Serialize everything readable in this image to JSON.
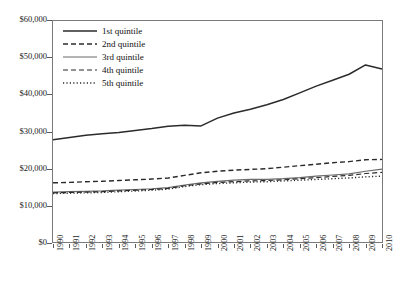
{
  "chart_data": {
    "type": "line",
    "title": "",
    "subtitle": "",
    "xlabel": "",
    "ylabel": "",
    "grid": false,
    "legend_position": "top-left-inside",
    "xlim": [
      1990,
      2010
    ],
    "ylim": [
      0,
      60000
    ],
    "y_tick_labels": [
      "$60,000",
      "$50,000",
      "$40,000",
      "$30,000",
      "$20,000",
      "$10,000",
      "$0"
    ],
    "y_tick_values": [
      60000,
      50000,
      40000,
      30000,
      20000,
      10000,
      0
    ],
    "x": [
      1990,
      1991,
      1992,
      1993,
      1994,
      1995,
      1996,
      1997,
      1998,
      1999,
      2000,
      2001,
      2002,
      2003,
      2004,
      2005,
      2006,
      2007,
      2008,
      2009,
      2010
    ],
    "categories": [
      "1990",
      "1991",
      "1992",
      "1993",
      "1994",
      "1995",
      "1996",
      "1997",
      "1998",
      "1999",
      "2000",
      "2001",
      "2002",
      "2003",
      "2004",
      "2005",
      "2006",
      "2007",
      "2008",
      "2009",
      "2010"
    ],
    "series": [
      {
        "name": "1st quintile",
        "style": "solid",
        "color": "#2b2b2b",
        "width": 1.5,
        "values": [
          27800,
          28400,
          29000,
          29400,
          29700,
          30300,
          30800,
          31400,
          31700,
          31500,
          33600,
          35000,
          36000,
          37200,
          38600,
          40400,
          42200,
          43800,
          45400,
          47900,
          46800
        ]
      },
      {
        "name": "2nd quintile",
        "style": "dashed",
        "color": "#2b2b2b",
        "width": 1.4,
        "values": [
          16200,
          16300,
          16500,
          16600,
          16800,
          17000,
          17200,
          17500,
          18200,
          18900,
          19300,
          19600,
          19800,
          20000,
          20400,
          20800,
          21200,
          21600,
          21900,
          22400,
          22500
        ]
      },
      {
        "name": "3rd quintile",
        "style": "solid",
        "color": "#6a6a6a",
        "width": 1.2,
        "values": [
          13700,
          13800,
          13900,
          14000,
          14200,
          14400,
          14600,
          14900,
          15600,
          16200,
          16600,
          16900,
          17100,
          17100,
          17300,
          17600,
          18000,
          18300,
          18600,
          19300,
          19900
        ]
      },
      {
        "name": "4th quintile",
        "style": "dashed",
        "color": "#2b2b2b",
        "width": 1.2,
        "values": [
          13500,
          13600,
          13700,
          13800,
          14000,
          14200,
          14400,
          14700,
          15400,
          15900,
          16300,
          16500,
          16700,
          16800,
          17000,
          17300,
          17600,
          17900,
          18200,
          18700,
          19000
        ]
      },
      {
        "name": "5th quintile",
        "style": "dotted",
        "color": "#2b2b2b",
        "width": 1.4,
        "values": [
          13300,
          13400,
          13500,
          13600,
          13800,
          14000,
          14200,
          14500,
          15200,
          15700,
          16000,
          16200,
          16400,
          16500,
          16700,
          16900,
          17100,
          17300,
          17500,
          17800,
          18000
        ]
      }
    ]
  },
  "legend": {
    "items": [
      {
        "label": "1st quintile"
      },
      {
        "label": "2nd quintile"
      },
      {
        "label": "3rd quintile"
      },
      {
        "label": "4th quintile"
      },
      {
        "label": "5th quintile"
      }
    ]
  },
  "axes": {
    "y_labels": [
      "$60,000",
      "$50,000",
      "$40,000",
      "$30,000",
      "$20,000",
      "$10,000",
      "$0"
    ],
    "x_labels": [
      "1990",
      "1991",
      "1992",
      "1993",
      "1994",
      "1995",
      "1996",
      "1997",
      "1998",
      "1999",
      "2000",
      "2001",
      "2002",
      "2003",
      "2004",
      "2005",
      "2006",
      "2007",
      "2008",
      "2009",
      "2010"
    ]
  }
}
